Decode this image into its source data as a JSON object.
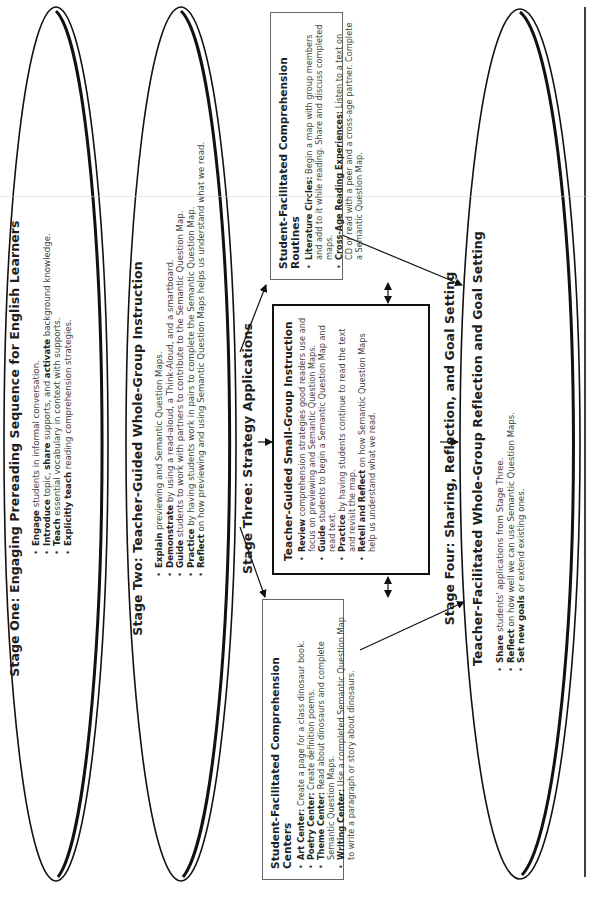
{
  "stage_one": {
    "title": "Stage One: Engaging Prereading Sequence for English Learners",
    "items": [
      {
        "bold": "Engage",
        "text": " students in informal conversation."
      },
      {
        "bold": "Introduce",
        "text": " topic, ",
        "bold2": "share",
        "text2": " supports, and ",
        "bold3": "activate",
        "text3": " background knowledge."
      },
      {
        "bold": "Teach",
        "text": " essential vocabulary in context with supports."
      },
      {
        "bold": "Explicitly teach",
        "text": " reading comprehension strategies."
      }
    ]
  },
  "stage_two": {
    "title": "Stage Two: Teacher-Guided Whole-Group Instruction",
    "items": [
      {
        "bold": "Explain",
        "text": " previewing and Semantic Question Maps."
      },
      {
        "bold": "Demonstrate",
        "text": " by using a read-aloud, a Think-Aloud, and a smartboard."
      },
      {
        "bold": "Guide",
        "text": " students to work with partners to contribute to the Semantic Question Map."
      },
      {
        "bold": "Practice",
        "text": " by having students work in pairs to complete the Semantic Question Map."
      },
      {
        "bold": "Reflect",
        "text": " on how previewing and using Semantic Question Maps helps us understand what we read."
      }
    ]
  },
  "stage_three": {
    "title": "Stage Three: Strategy Applications",
    "centers": {
      "title": "Student-Facilitated Comprehension Centers",
      "items": [
        {
          "bold": "Art Center:",
          "text": " Create a page for a class dinosaur book."
        },
        {
          "bold": "Poetry Center:",
          "text": " Create definition poems."
        },
        {
          "bold": "Theme Center:",
          "text": " Read about dinosaurs and complete Semantic Question Maps."
        },
        {
          "bold": "Writing Center:",
          "text": " Use a completed Semantic Question Map to write a paragraph or story about dinosaurs."
        }
      ]
    },
    "small_group": {
      "title": "Teacher-Guided Small-Group Instruction",
      "items": [
        {
          "bold": "Review",
          "text": " comprehension strategies good readers use and focus on previewing and Semantic Question Maps."
        },
        {
          "bold": "Guide",
          "text": " students to begin a Semantic Question Map and read text."
        },
        {
          "bold": "Practice",
          "text": " by having students continue to read the text and revisit the map."
        },
        {
          "bold": "Retell and Reflect",
          "text": " on how Semantic Question Maps help us understand what we read."
        }
      ]
    },
    "routines": {
      "title": "Student-Facilitated Comprehension Routines",
      "items": [
        {
          "bold": "Literature Circles:",
          "text": " Begin a map with group members and add to it while reading. Share and discuss completed maps."
        },
        {
          "bold": "Cross-Age Reading Experiences:",
          "text": " Listen to a text on CD or read with a peer and a cross-age partner. Complete a Semantic Question Map."
        }
      ]
    }
  },
  "stage_four": {
    "title": "Stage Four: Sharing, Reflection, and Goal Setting",
    "subtitle": "Teacher-Facilitated Whole-Group Reflection and Goal Setting",
    "items": [
      {
        "bold": "Share",
        "text": " students' applications from Stage Three."
      },
      {
        "bold": "Reflect",
        "text": " on how well we can use Semantic Question Maps."
      },
      {
        "bold": "Set new goals",
        "text": " or extend existing ones."
      }
    ]
  },
  "colors": {
    "ink": "#111111",
    "text": "#2a2a2a",
    "body_text": "#444444",
    "thin_border": "#666666",
    "background": "#ffffff"
  }
}
